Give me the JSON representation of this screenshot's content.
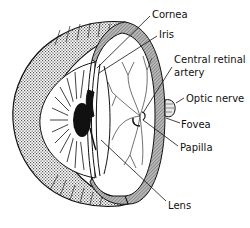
{
  "diagram": {
    "labels": {
      "cornea": "Cornea",
      "iris": "Iris",
      "central_retinal_artery_line1": "Central retinal",
      "central_retinal_artery_line2": "artery",
      "optic_nerve": "Optic nerve",
      "fovea": "Fovea",
      "papilla": "Papilla",
      "lens": "Lens"
    },
    "colors": {
      "line": "#111111",
      "sclera_cut": "#9a9a9a",
      "outer_shell": "#cfcfcf",
      "background": "#ffffff"
    }
  }
}
